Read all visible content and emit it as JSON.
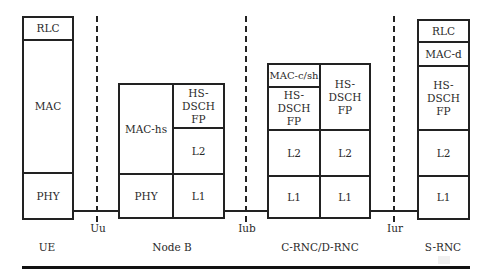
{
  "diagram": {
    "nodes": {
      "ue": {
        "label": "UE",
        "layers": [
          "RLC",
          "MAC",
          "PHY"
        ]
      },
      "nodeb": {
        "label": "Node B",
        "layers": {
          "mac_hs": "MAC-hs",
          "phy": "PHY",
          "fp": "HS-DSCH FP",
          "l2": "L2",
          "l1": "L1"
        }
      },
      "crnc": {
        "label": "C-RNC/D-RNC",
        "layers": {
          "mac_csh": "MAC-c/sh",
          "fp_left": "HS- DSCH FP",
          "fp_right": "HS- DSCH FP",
          "l2_left": "L2",
          "l2_right": "L2",
          "l1_left": "L1",
          "l1_right": "L1"
        }
      },
      "srnc": {
        "label": "S-RNC",
        "layers": [
          "RLC",
          "MAC-d",
          "HS- DSCH FP",
          "L2",
          "L1"
        ]
      }
    },
    "interfaces": [
      {
        "label": "Uu"
      },
      {
        "label": "Iub"
      },
      {
        "label": "Iur"
      }
    ],
    "colors": {
      "line": "#222222",
      "background": "#ffffff",
      "text": "#2a2a2a"
    }
  }
}
